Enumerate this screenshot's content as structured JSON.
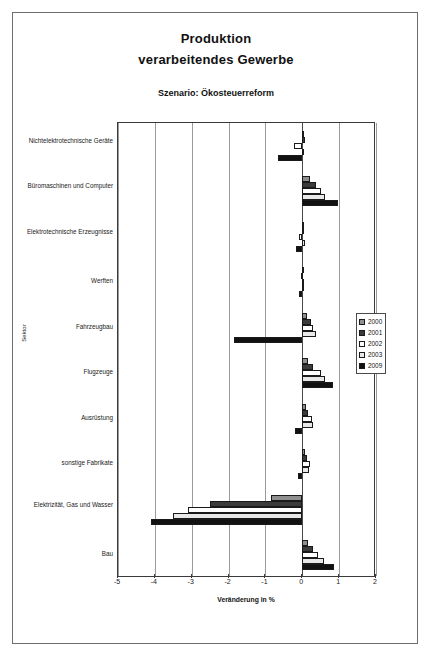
{
  "figure": {
    "title_lines": [
      "Produktion",
      "verarbeitendes Gewerbe"
    ],
    "subtitle": "Szenario: Ökosteuerreform"
  },
  "legend": {
    "position": "right",
    "entries": [
      {
        "label": "2000",
        "color": "#8f8f8f",
        "swatch": "legend-swatch-2000"
      },
      {
        "label": "2001",
        "color": "#3b3b3b",
        "swatch": "legend-swatch-2001"
      },
      {
        "label": "2002",
        "color": "#ffffff",
        "swatch": "legend-swatch-2002"
      },
      {
        "label": "2003",
        "color": "#e8e8e8",
        "swatch": "legend-swatch-2003"
      },
      {
        "label": "2009",
        "color": "#111111",
        "swatch": "legend-swatch-2009"
      }
    ]
  },
  "axes": {
    "x_title": "Veränderung in %",
    "y_title": "Sektor",
    "x_ticks": [
      "-5",
      "-4",
      "-3",
      "-2",
      "-1",
      "0",
      "1",
      "2"
    ]
  },
  "chart_data": {
    "type": "bar",
    "orientation": "horizontal",
    "title": "Produktion verarbeitendes Gewerbe",
    "subtitle": "Szenario: Ökosteuerreform",
    "xlabel": "Veränderung in %",
    "ylabel": "Sektor",
    "xlim": [
      -5,
      2
    ],
    "xticks": [
      -5,
      -4,
      -3,
      -2,
      -1,
      0,
      1,
      2
    ],
    "grid": true,
    "legend_position": "right",
    "categories": [
      "Nichtelektrotechnische Geräte",
      "Büromaschinen und Computer",
      "Elektrotechnische Erzeugnisse",
      "Werften",
      "Fahrzeugbau",
      "Flugzeuge",
      "Ausrüstung",
      "sonstige Fabrikate",
      "Elektrizität, Gas und Wasser",
      "Bau"
    ],
    "series": [
      {
        "name": "2000",
        "color": "#8f8f8f",
        "values": [
          0.06,
          0.22,
          0.05,
          0.03,
          0.12,
          0.16,
          0.1,
          0.08,
          -0.85,
          0.16
        ]
      },
      {
        "name": "2001",
        "color": "#3b3b3b",
        "values": [
          0.07,
          0.36,
          0.04,
          -0.03,
          0.24,
          0.3,
          0.16,
          0.12,
          -2.5,
          0.3
        ]
      },
      {
        "name": "2002",
        "color": "#ffffff",
        "values": [
          -0.22,
          0.5,
          -0.09,
          0.06,
          0.3,
          0.5,
          0.26,
          0.2,
          -3.1,
          0.44
        ]
      },
      {
        "name": "2003",
        "color": "#e8e8e8",
        "values": [
          0.05,
          0.62,
          0.07,
          0.05,
          0.36,
          0.62,
          0.3,
          0.18,
          -3.5,
          0.6
        ]
      },
      {
        "name": "2009",
        "color": "#111111",
        "values": [
          -0.66,
          0.98,
          -0.18,
          -0.1,
          -1.85,
          0.82,
          -0.2,
          -0.12,
          -4.1,
          0.85
        ]
      }
    ]
  }
}
